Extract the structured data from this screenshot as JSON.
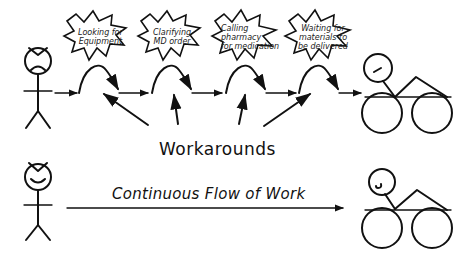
{
  "diagram": {
    "type": "process-flow-comparison",
    "colors": {
      "ink": "#111111",
      "background": "#ffffff"
    },
    "top_row": {
      "start_actor": {
        "mood": "frowning",
        "icon": "stick-figure-frown-icon"
      },
      "end_actor": {
        "mood": "neutral",
        "icon": "bicycle-rider-icon"
      },
      "bubbles": [
        {
          "lines": [
            "Looking for",
            "Equipment"
          ]
        },
        {
          "lines": [
            "Clarifying",
            "MD order"
          ]
        },
        {
          "lines": [
            "Calling",
            "pharmacy",
            "for medication"
          ]
        },
        {
          "lines": [
            "Waiting for",
            "materials to",
            "be delivered"
          ]
        }
      ],
      "caption": "Workarounds"
    },
    "bottom_row": {
      "start_actor": {
        "mood": "smiling",
        "icon": "stick-figure-smile-icon"
      },
      "end_actor": {
        "mood": "smiling",
        "icon": "bicycle-rider-icon"
      },
      "caption": "Continuous Flow of Work"
    }
  }
}
